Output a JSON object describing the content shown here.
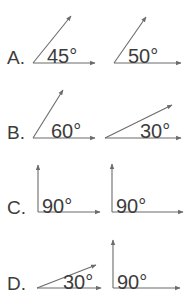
{
  "page": {
    "width": 184,
    "height": 308,
    "background_color": "#ffffff",
    "stroke_color": "#6b6b6b",
    "text_color": "#3c3c3c"
  },
  "rows": [
    {
      "label": "A.",
      "label_x": 7,
      "label_y": 62,
      "figures": [
        {
          "name": "angle-45",
          "value_text": "45°",
          "degrees": 45,
          "text_x": 47,
          "text_y": 62,
          "vertex": [
            33,
            63
          ],
          "horizontal_tip": [
            95,
            63
          ],
          "ray_tip": [
            71,
            16
          ]
        },
        {
          "name": "angle-50",
          "value_text": "50°",
          "degrees": 50,
          "text_x": 128,
          "text_y": 62,
          "vertex": [
            114,
            63
          ],
          "horizontal_tip": [
            181,
            63
          ],
          "ray_tip": [
            146,
            17
          ]
        }
      ]
    },
    {
      "label": "B.",
      "label_x": 7,
      "label_y": 137,
      "figures": [
        {
          "name": "angle-60",
          "value_text": "60°",
          "degrees": 60,
          "text_x": 51,
          "text_y": 137,
          "vertex": [
            33,
            138
          ],
          "horizontal_tip": [
            95,
            138
          ],
          "ray_tip": [
            63,
            90
          ]
        },
        {
          "name": "angle-30",
          "value_text": "30°",
          "degrees": 30,
          "text_x": 140,
          "text_y": 137,
          "vertex": [
            105,
            138
          ],
          "horizontal_tip": [
            181,
            138
          ],
          "ray_tip": [
            172,
            105
          ]
        }
      ]
    },
    {
      "label": "C.",
      "label_x": 7,
      "label_y": 212,
      "figures": [
        {
          "name": "angle-90-left",
          "value_text": "90°",
          "degrees": 90,
          "text_x": 42,
          "text_y": 212,
          "vertex": [
            38,
            212
          ],
          "horizontal_tip": [
            100,
            212
          ],
          "ray_tip": [
            38,
            165
          ]
        },
        {
          "name": "angle-90-right",
          "value_text": "90°",
          "degrees": 90,
          "text_x": 116,
          "text_y": 212,
          "vertex": [
            112,
            212
          ],
          "horizontal_tip": [
            183,
            212
          ],
          "ray_tip": [
            112,
            164
          ]
        }
      ]
    },
    {
      "label": "D.",
      "label_x": 7,
      "label_y": 288,
      "figures": [
        {
          "name": "angle-30-d",
          "value_text": "30°",
          "degrees": 30,
          "text_x": 63,
          "text_y": 288,
          "vertex": [
            37,
            288
          ],
          "horizontal_tip": [
            101,
            288
          ],
          "ray_tip": [
            96,
            265
          ]
        },
        {
          "name": "angle-90-d",
          "value_text": "90°",
          "degrees": 90,
          "text_x": 117,
          "text_y": 288,
          "vertex": [
            113,
            288
          ],
          "horizontal_tip": [
            180,
            288
          ],
          "ray_tip": [
            113,
            240
          ]
        }
      ]
    }
  ]
}
